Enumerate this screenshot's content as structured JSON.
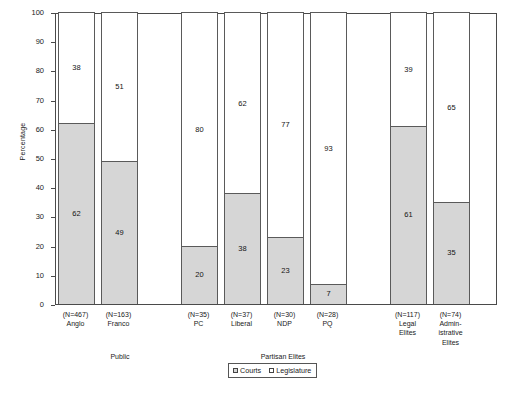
{
  "chart_data": {
    "type": "bar",
    "subtype": "stacked-bar-100",
    "title": "",
    "xlabel": "",
    "ylabel": "Percentage",
    "ylim": [
      0,
      100
    ],
    "ytick_step": 10,
    "yticks": [
      "100",
      "90",
      "80",
      "70",
      "60",
      "50",
      "40",
      "30",
      "20",
      "10",
      "0"
    ],
    "grid": false,
    "legend_position": "bottom-center",
    "categories": [
      "Anglo",
      "Franco",
      "PC",
      "Liberal",
      "NDP",
      "PQ",
      "Legal Elites",
      "Administrative Elites"
    ],
    "series": [
      {
        "name": "Courts",
        "color": "#d6d6d6",
        "values": [
          62,
          49,
          20,
          38,
          23,
          7,
          61,
          35
        ]
      },
      {
        "name": "Legislature",
        "color": "#ffffff",
        "values": [
          38,
          51,
          80,
          62,
          77,
          93,
          39,
          65
        ]
      }
    ],
    "n_labels": [
      "(N=467)",
      "(N=163)",
      "(N=35)",
      "(N=37)",
      "(N=30)",
      "(N=28)",
      "(N=117)",
      "(N=74)"
    ],
    "group_labels": [
      "Public",
      "Partisan Elites"
    ]
  },
  "axis": {
    "y_title": "Percentage"
  },
  "bars": [
    {
      "name": "Anglo",
      "n": "(N=467)",
      "label1": "Anglo",
      "label2": "",
      "label3": "",
      "courts": 62,
      "legislature": 38,
      "courts_text": "62",
      "legislature_text": "38"
    },
    {
      "name": "Franco",
      "n": "(N=163)",
      "label1": "Franco",
      "label2": "",
      "label3": "",
      "courts": 49,
      "legislature": 51,
      "courts_text": "49",
      "legislature_text": "51"
    },
    {
      "name": "PC",
      "n": "(N=35)",
      "label1": "PC",
      "label2": "",
      "label3": "",
      "courts": 20,
      "legislature": 80,
      "courts_text": "20",
      "legislature_text": "80"
    },
    {
      "name": "Liberal",
      "n": "(N=37)",
      "label1": "Liberal",
      "label2": "",
      "label3": "",
      "courts": 38,
      "legislature": 62,
      "courts_text": "38",
      "legislature_text": "62"
    },
    {
      "name": "NDP",
      "n": "(N=30)",
      "label1": "NDP",
      "label2": "",
      "label3": "",
      "courts": 23,
      "legislature": 77,
      "courts_text": "23",
      "legislature_text": "77"
    },
    {
      "name": "PQ",
      "n": "(N=28)",
      "label1": "PQ",
      "label2": "",
      "label3": "",
      "courts": 7,
      "legislature": 93,
      "courts_text": "7",
      "legislature_text": "93"
    },
    {
      "name": "Legal Elites",
      "n": "(N=117)",
      "label1": "Legal",
      "label2": "Elites",
      "label3": "",
      "courts": 61,
      "legislature": 39,
      "courts_text": "61",
      "legislature_text": "39"
    },
    {
      "name": "Administrative Elites",
      "n": "(N=74)",
      "label1": "Admin-",
      "label2": "istrative",
      "label3": "Elites",
      "courts": 35,
      "legislature": 65,
      "courts_text": "35",
      "legislature_text": "65"
    }
  ],
  "groups": [
    {
      "label": "Public"
    },
    {
      "label": "Partisan Elites"
    }
  ],
  "legend": {
    "items": [
      {
        "label": "Courts",
        "swatch": "#d6d6d6"
      },
      {
        "label": "Legislature",
        "swatch": "#ffffff"
      }
    ]
  }
}
